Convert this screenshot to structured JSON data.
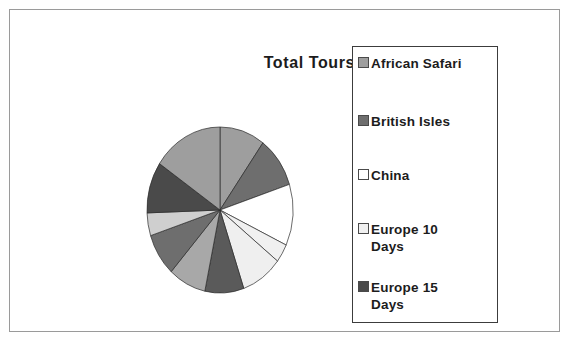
{
  "frame": {
    "border_color": "#9a9a9a",
    "background": "#ffffff"
  },
  "title": {
    "text": "Total Tours"
  },
  "legend": {
    "border_color": "#3c3c3c",
    "entries": [
      {
        "label": "African Safari",
        "swatch_color": "#9e9e9e",
        "swatch_name": "swatch-african-safari"
      },
      {
        "label": "British Isles",
        "swatch_color": "#6e6e6e",
        "swatch_name": "swatch-british-isles"
      },
      {
        "label": "China",
        "swatch_color": "#ffffff",
        "swatch_name": "swatch-china"
      },
      {
        "label": "Europe 10\nDays",
        "swatch_color": "#f0f0f0",
        "swatch_name": "swatch-europe-10-days"
      },
      {
        "label": "Europe 15\nDays",
        "swatch_color": "#4a4a4a",
        "swatch_name": "swatch-europe-15-days"
      }
    ]
  },
  "chart_data": {
    "type": "pie",
    "title": "Total Tours",
    "xlabel": "",
    "ylabel": "",
    "legend_position": "right",
    "grid": false,
    "start_angle_deg": 0,
    "direction": "clockwise",
    "categories": [
      "African Safari",
      "British Isles",
      "China",
      "Europe 10 Days",
      "Europe 15 Days",
      "Slice 6",
      "Slice 7",
      "Slice 8",
      "Slice 9",
      "Slice 10",
      "Slice 11"
    ],
    "values": [
      11,
      11,
      13,
      4,
      10,
      9,
      9,
      9,
      8,
      8,
      8
    ],
    "slices": [
      {
        "label": "African Safari",
        "angle_start_deg": 0,
        "angle_end_deg": 36,
        "color": "#9e9e9e"
      },
      {
        "label": "British Isles",
        "angle_start_deg": 36,
        "angle_end_deg": 72,
        "color": "#6e6e6e"
      },
      {
        "label": "China",
        "angle_start_deg": 72,
        "angle_end_deg": 115,
        "color": "#ffffff"
      },
      {
        "label": "Europe 10 Days",
        "angle_start_deg": 115,
        "angle_end_deg": 128,
        "color": "#f0f0f0"
      },
      {
        "label": "Europe 15 Days",
        "angle_start_deg": 128,
        "angle_end_deg": 161,
        "color": "#efefef"
      },
      {
        "label": "Slice 6",
        "angle_start_deg": 161,
        "angle_end_deg": 192,
        "color": "#5a5a5a"
      },
      {
        "label": "Slice 7",
        "angle_start_deg": 192,
        "angle_end_deg": 222,
        "color": "#a8a8a8"
      },
      {
        "label": "Slice 8",
        "angle_start_deg": 222,
        "angle_end_deg": 252,
        "color": "#6e6e6e"
      },
      {
        "label": "Slice 9",
        "angle_start_deg": 252,
        "angle_end_deg": 268,
        "color": "#cfcfcf"
      },
      {
        "label": "Slice 10",
        "angle_start_deg": 268,
        "angle_end_deg": 304,
        "color": "#4a4a4a"
      },
      {
        "label": "Slice 11",
        "angle_start_deg": 304,
        "angle_end_deg": 360,
        "color": "#9e9e9e"
      }
    ],
    "geometry": {
      "center_x": 80,
      "center_y": 90,
      "radius_x": 73,
      "radius_y": 83
    }
  }
}
